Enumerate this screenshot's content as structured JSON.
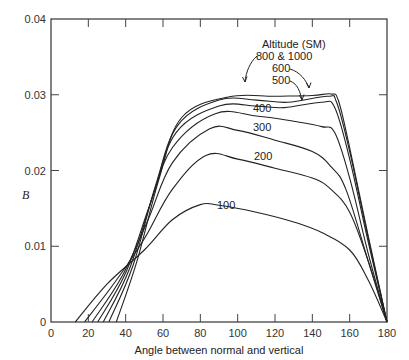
{
  "chart_data": {
    "type": "line",
    "title": "",
    "xlabel": "Angle between normal and vertical",
    "ylabel": "B",
    "xlim": [
      0,
      180
    ],
    "ylim": [
      0,
      0.04
    ],
    "x_ticks": [
      0,
      20,
      40,
      60,
      80,
      100,
      120,
      140,
      160,
      180
    ],
    "y_ticks": [
      0,
      0.01,
      0.02,
      0.03,
      0.04
    ],
    "y_tick_labels": [
      "0",
      "0.01",
      "0.02",
      "0.03",
      "0.04"
    ],
    "grid": false,
    "legend_title": "Altitude (SM)",
    "series": [
      {
        "name": "100",
        "x": [
          13,
          30,
          50,
          65,
          80,
          90,
          110,
          130,
          145,
          160,
          170,
          180
        ],
        "y": [
          0,
          0.005,
          0.0095,
          0.0135,
          0.0155,
          0.0154,
          0.0145,
          0.0132,
          0.0118,
          0.0095,
          0.0055,
          0
        ]
      },
      {
        "name": "200",
        "x": [
          18,
          35,
          50,
          65,
          83,
          100,
          120,
          140,
          150,
          160,
          170,
          180
        ],
        "y": [
          0,
          0.0055,
          0.011,
          0.0175,
          0.022,
          0.0215,
          0.0203,
          0.019,
          0.0175,
          0.0145,
          0.008,
          0
        ]
      },
      {
        "name": "300",
        "x": [
          22,
          38,
          52,
          65,
          85,
          100,
          120,
          140,
          150,
          158,
          170,
          180
        ],
        "y": [
          0,
          0.006,
          0.0135,
          0.021,
          0.0255,
          0.0253,
          0.024,
          0.0225,
          0.0205,
          0.0175,
          0.008,
          0
        ]
      },
      {
        "name": "400",
        "x": [
          25,
          40,
          53,
          65,
          88,
          110,
          130,
          145,
          152,
          160,
          170,
          180
        ],
        "y": [
          0,
          0.0065,
          0.0155,
          0.023,
          0.0275,
          0.0272,
          0.0265,
          0.0258,
          0.025,
          0.019,
          0.009,
          0
        ]
      },
      {
        "name": "500",
        "x": [
          28,
          42,
          55,
          67,
          90,
          110,
          125,
          145,
          152,
          160,
          170,
          180
        ],
        "y": [
          0,
          0.007,
          0.017,
          0.025,
          0.0285,
          0.0285,
          0.0283,
          0.029,
          0.0283,
          0.0215,
          0.0105,
          0
        ]
      },
      {
        "name": "600",
        "x": [
          31,
          44,
          56,
          68,
          90,
          110,
          127,
          148,
          153,
          160,
          170,
          180
        ],
        "y": [
          0,
          0.0075,
          0.018,
          0.026,
          0.0293,
          0.0293,
          0.029,
          0.0298,
          0.029,
          0.0225,
          0.011,
          0
        ]
      },
      {
        "name": "800 & 1000",
        "x": [
          35,
          46,
          58,
          70,
          95,
          120,
          140,
          150,
          154,
          160,
          170,
          180
        ],
        "y": [
          0,
          0.008,
          0.019,
          0.027,
          0.0297,
          0.0298,
          0.0299,
          0.0301,
          0.0292,
          0.023,
          0.0113,
          0
        ]
      }
    ],
    "annotations": [
      "Altitude (SM)",
      "800 & 1000",
      "600",
      "500",
      "400",
      "300",
      "200",
      "100"
    ]
  }
}
